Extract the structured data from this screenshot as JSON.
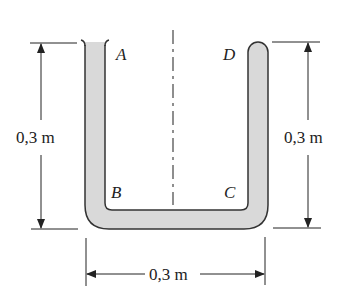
{
  "figure": {
    "points": {
      "A": "A",
      "B": "B",
      "C": "C",
      "D": "D"
    },
    "dimensions": {
      "left_height": "0,3 m",
      "right_height": "0,3 m",
      "bottom_width": "0,3 m"
    },
    "colors": {
      "liquid_fill": "#d9d9d9",
      "outline": "#333333"
    }
  }
}
